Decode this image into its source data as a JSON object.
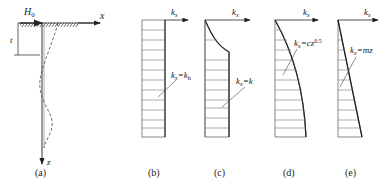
{
  "figure": {
    "panel_a": {
      "caption": "(a)",
      "load_label": "H",
      "load_sub": "0",
      "x_axis": "x",
      "z_axis": "z",
      "dim_label": "t"
    },
    "panel_b": {
      "caption": "(b)",
      "axis_label": "k",
      "axis_sub": "x",
      "eq_lhs": "k",
      "eq_lhs_sub": "x",
      "eq_rhs": "=k",
      "eq_rhs_sub": "h"
    },
    "panel_c": {
      "caption": "(c)",
      "axis_label": "k",
      "axis_sub": "x",
      "eq_lhs": "k",
      "eq_lhs_sub": "x",
      "eq_rhs": "=k",
      "eq_rhs_sub": ""
    },
    "panel_d": {
      "caption": "(d)",
      "axis_label": "k",
      "axis_sub": "x",
      "eq_lhs": "k",
      "eq_lhs_sub": "x",
      "eq_rhs": "=cz",
      "eq_rhs_sup": "0.5"
    },
    "panel_e": {
      "caption": "(e)",
      "axis_label": "k",
      "axis_sub": "x",
      "eq_lhs": "k",
      "eq_lhs_sub": "x",
      "eq_rhs": "=mz"
    },
    "colors": {
      "ink": "#222222",
      "hatch": "#444444"
    }
  }
}
